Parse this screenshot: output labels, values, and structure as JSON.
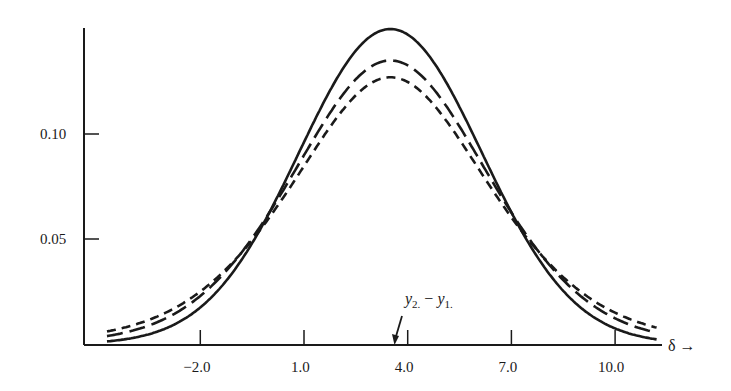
{
  "chart_data": {
    "type": "line",
    "title": "",
    "xlabel": "δ →",
    "ylabel": "",
    "xlim": [
      -5.5,
      11.6
    ],
    "ylim": [
      0,
      0.155
    ],
    "grid": false,
    "legend": null,
    "x_ticks": [
      {
        "value": -2.0,
        "label": "−2.0"
      },
      {
        "value": 1.0,
        "label": "1.0"
      },
      {
        "value": 4.0,
        "label": "4.0"
      },
      {
        "value": 7.0,
        "label": "7.0"
      },
      {
        "value": 10.0,
        "label": "10.0"
      }
    ],
    "y_ticks": [
      {
        "value": 0.05,
        "label": "0.05"
      },
      {
        "value": 0.1,
        "label": "0.10"
      }
    ],
    "series": [
      {
        "name": "solid",
        "style": "solid",
        "center": 3.5,
        "peak": 0.15,
        "spread": 2.65,
        "tail": 0,
        "x": [
          -4.7,
          -2.0,
          1.0,
          3.5,
          4.0,
          7.0,
          10.0,
          11.2
        ],
        "y": [
          0.006,
          0.026,
          0.083,
          0.15,
          0.148,
          0.065,
          0.013,
          0.006
        ]
      },
      {
        "name": "long-dash",
        "style": "long-dash",
        "center": 3.5,
        "peak": 0.135,
        "spread": 2.95,
        "tail": 0.25,
        "x": [
          -4.7,
          -2.0,
          1.0,
          3.5,
          4.0,
          7.0,
          10.0,
          11.2
        ],
        "y": [
          0.008,
          0.03,
          0.085,
          0.135,
          0.133,
          0.068,
          0.016,
          0.008
        ]
      },
      {
        "name": "short-dash",
        "style": "short-dash",
        "center": 3.5,
        "peak": 0.127,
        "spread": 3.15,
        "tail": 0.5,
        "x": [
          -4.7,
          -2.0,
          1.0,
          3.5,
          4.0,
          7.0,
          10.0,
          11.2
        ],
        "y": [
          0.011,
          0.034,
          0.084,
          0.127,
          0.125,
          0.069,
          0.02,
          0.011
        ]
      }
    ],
    "annotations": [
      {
        "text": "y₂. − y₁.",
        "points_to_x": 3.6,
        "kind": "arrow"
      }
    ]
  },
  "annotation": {
    "y2": "y",
    "y2_sub": "2.",
    "minus": " − ",
    "y1": "y",
    "y1_sub": "1."
  },
  "axis": {
    "x_label": "δ →"
  }
}
